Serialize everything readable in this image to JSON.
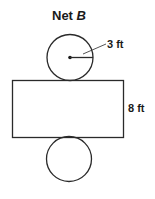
{
  "diagram": {
    "title_prefix": "Net ",
    "title_variable": "B",
    "shape": "cylinder net",
    "top_circle": {
      "radius_label": "3 ft"
    },
    "rectangle": {
      "height_label": "8 ft"
    },
    "bottom_circle": {},
    "colors": {
      "stroke": "#2a2a2a",
      "text": "#1a1a1a",
      "background": "#ffffff"
    }
  }
}
